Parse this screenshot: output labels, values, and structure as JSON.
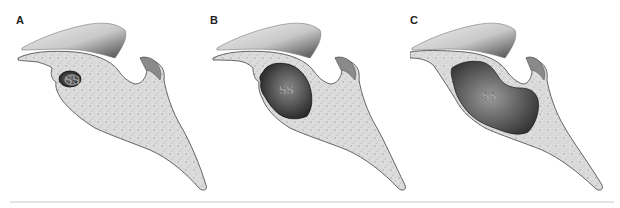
{
  "figure": {
    "panels": [
      {
        "id": "A",
        "label": "A",
        "sinus_label": "SS",
        "pneumatization": "small"
      },
      {
        "id": "B",
        "label": "B",
        "sinus_label": "SS",
        "pneumatization": "medium"
      },
      {
        "id": "C",
        "label": "C",
        "sinus_label": "SS",
        "pneumatization": "large"
      }
    ],
    "colors": {
      "bone_fill": "#d9d9d9",
      "bone_outline": "#555555",
      "sinus_dark": "#2e2e2e",
      "sinus_mid": "#6b6b6b",
      "soft_tissue": "#b5b5b5",
      "rule": "#e4e4e4"
    }
  }
}
